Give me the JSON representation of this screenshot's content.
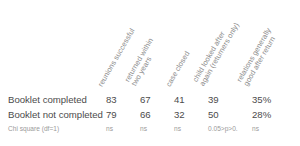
{
  "table": {
    "columns": [
      {
        "id": "reunions-successful",
        "lines": [
          "reunions successful"
        ]
      },
      {
        "id": "returned-within-two-years",
        "lines": [
          "returned within",
          "two years"
        ]
      },
      {
        "id": "case-closed",
        "lines": [
          "case closed"
        ]
      },
      {
        "id": "child-looked-after-again",
        "lines": [
          "child looked after",
          "again  (returners only)"
        ]
      },
      {
        "id": "relations-generally-good",
        "lines": [
          "relations generally",
          "good after return"
        ]
      }
    ],
    "rows": [
      {
        "id": "booklet-completed",
        "label": "Booklet completed",
        "values": [
          "83",
          "67",
          "41",
          "39",
          "35%"
        ]
      },
      {
        "id": "booklet-not-completed",
        "label": "Booklet not completed",
        "values": [
          "79",
          "66",
          "32",
          "50",
          "28%"
        ]
      }
    ],
    "stats_row": {
      "id": "chi-square",
      "label": "Chi square (df=1)",
      "values": [
        "ns",
        "ns",
        "ns",
        "0.05>p>0.",
        "ns"
      ]
    },
    "colors": {
      "background": "#ffffff",
      "body_text": "#4b4b4b",
      "header_text": "#8d8d8d",
      "stats_text": "#9a9a9a"
    }
  }
}
